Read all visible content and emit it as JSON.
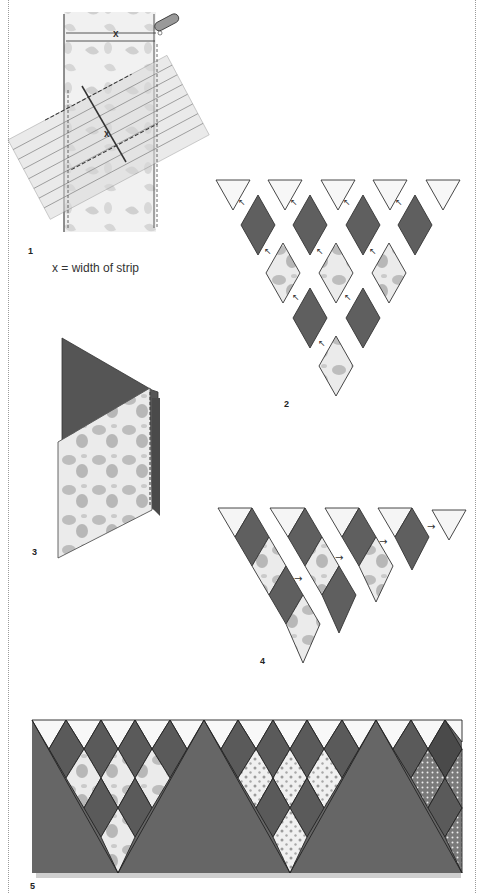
{
  "page": {
    "borders": [
      "dotted-left-rule",
      "dotted-right-rule"
    ]
  },
  "figures": [
    {
      "number": "1",
      "title": "Cutting strips at an angle from a fabric band",
      "caption": "x = width of strip",
      "measure_label": "x"
    },
    {
      "number": "2",
      "title": "Layout of triangles and diamonds with arrows indicating joining order",
      "rows": [
        {
          "shape": "triangle",
          "fill": "light",
          "count": 5
        },
        {
          "shape": "diamond",
          "fill": "dark",
          "count": 4
        },
        {
          "shape": "diamond",
          "fill": "patterned",
          "count": 3
        },
        {
          "shape": "diamond",
          "fill": "dark",
          "count": 2
        },
        {
          "shape": "diamond",
          "fill": "patterned",
          "count": 1
        }
      ],
      "arrow_glyph": "↖"
    },
    {
      "number": "3",
      "title": "Stitching a triangle to a patterned diamond (dashed seam line)"
    },
    {
      "number": "4",
      "title": "Diagonal strips joined with arrows",
      "arrow_glyph": "→",
      "strips": 5
    },
    {
      "number": "5",
      "title": "Finished border of triangles and diamonds",
      "top_triangles": 13
    }
  ],
  "colors": {
    "dark": "#5f5f5f",
    "dark_edge": "#2e2e2e",
    "light": "#f7f7f7",
    "pattern_bg": "#e9e9e9",
    "pattern_blob": "#a9a9a9",
    "rule": "#9a9a9a"
  }
}
